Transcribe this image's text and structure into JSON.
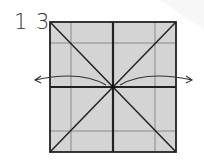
{
  "step": {
    "number": "1 3"
  },
  "diagram": {
    "colors": {
      "paper": "#d4d4d4",
      "outline": "#222222",
      "grid": "#8a8a8a",
      "arrow": "#333333",
      "background": "#ffffff"
    },
    "square": {
      "x": 50,
      "y": 22,
      "size": 126
    },
    "arrows": [
      {
        "direction": "left",
        "label": "unfold-left"
      },
      {
        "direction": "right",
        "label": "unfold-right"
      }
    ]
  }
}
